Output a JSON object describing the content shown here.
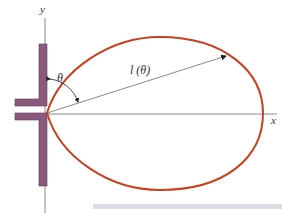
{
  "diagram": {
    "title": "",
    "axes": {
      "x_label": "x",
      "y_label": "y"
    },
    "labels": {
      "theta": "θ",
      "radius": "l (θ)"
    },
    "colors": {
      "lobe": "#c8401e",
      "antenna": "#8a5a7e",
      "antenna_edge": "#5e3a56",
      "axis": "#8a8a8a",
      "arrow": "#6a6a6a",
      "caption_bar": "#d9dee6"
    }
  }
}
